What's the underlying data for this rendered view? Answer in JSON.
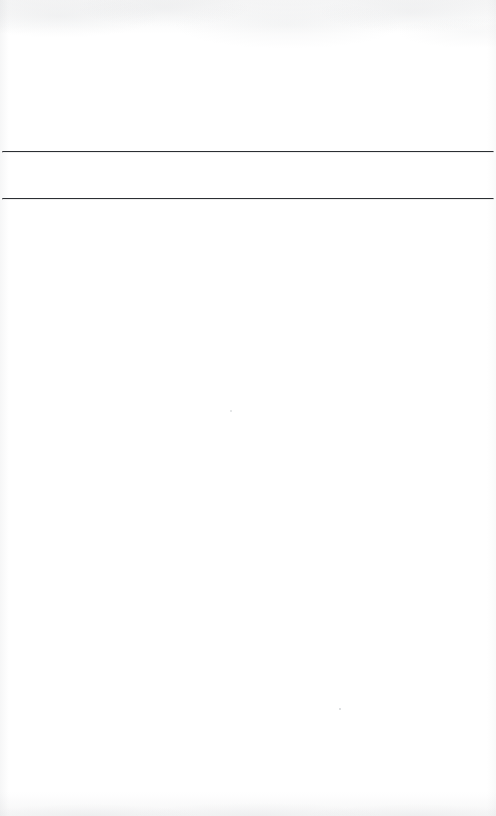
{
  "document": {
    "kind": "scanned-page",
    "page_label": "",
    "background_color": "#ffffff",
    "ink_color": "#2b2f33",
    "width_px": 496,
    "height_px": 816
  },
  "header_area": {
    "name": "header-blank-area",
    "text": ""
  },
  "rules": [
    {
      "name": "rule-top",
      "label": "",
      "y_px": 143,
      "x_start_px": 2,
      "x_end_px": 492,
      "thickness_px": 1.5,
      "color": "#2b2f33"
    },
    {
      "name": "rule-bottom",
      "label": "",
      "y_px": 190,
      "x_start_px": 2,
      "x_end_px": 492,
      "thickness_px": 1.5,
      "color": "#2b2f33"
    }
  ],
  "field_band": {
    "name": "field-band-between-rules",
    "text": "",
    "top_px": 145,
    "height_px": 45
  },
  "body_area": {
    "name": "body-blank-area",
    "text": ""
  },
  "artifacts": {
    "specks": [
      {
        "name": "scan-speck-upper",
        "x_px": 230,
        "y_px": 410
      },
      {
        "name": "scan-speck-lower",
        "x_px": 339,
        "y_px": 708
      }
    ],
    "edge_shading": "top-and-bottom"
  }
}
